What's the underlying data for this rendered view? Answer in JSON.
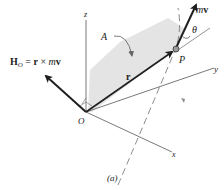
{
  "diagram": {
    "axes": {
      "z_label": "z",
      "y_label": "y",
      "x_label": "x",
      "origin_label": "O"
    },
    "vectors": {
      "position_label": "r",
      "momentum_label_m": "m",
      "momentum_label_v": "v",
      "angular_momentum": {
        "H": "H",
        "sub": "O",
        "eq": " = ",
        "r": "r",
        "cross": " × ",
        "m": "m",
        "v": "v"
      }
    },
    "point_label": "P",
    "angle_label": "θ",
    "area_label": "A",
    "caption": "(a)",
    "colors": {
      "shaded_area": "#e4e4e4",
      "vector_stroke": "#1f1f1f",
      "axis_stroke": "#555555",
      "trajectory_stroke": "#8a8a8a",
      "point_fill": "#9a9a9a"
    }
  }
}
